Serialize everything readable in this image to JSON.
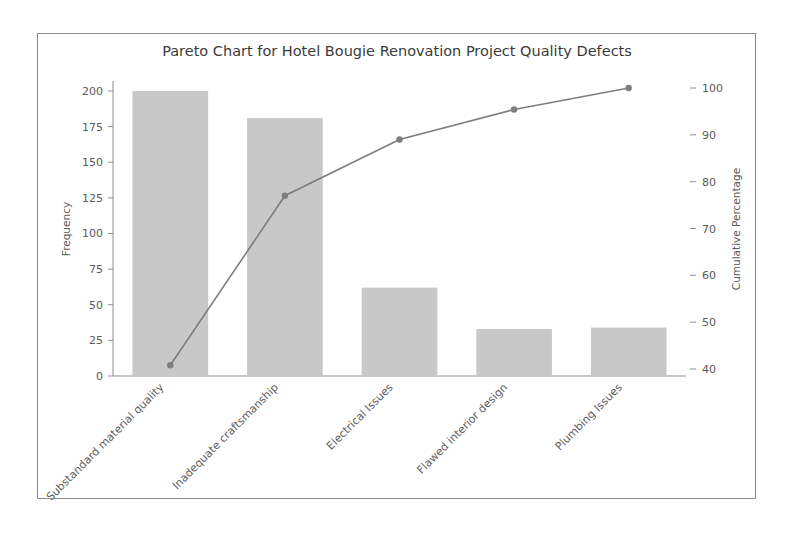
{
  "chart_data": {
    "type": "bar",
    "title": "Pareto Chart for Hotel Bougie Renovation Project Quality Defects",
    "categories": [
      "Substandard material quality",
      "Inadequate craftsmanship",
      "Electrical Issues",
      "Flawed interior design",
      "Plumbing Issues"
    ],
    "series": [
      {
        "name": "Frequency",
        "type": "bar",
        "axis": "left",
        "values": [
          200,
          181,
          62,
          33,
          34
        ]
      },
      {
        "name": "Cumulative Percentage",
        "type": "line",
        "axis": "right",
        "values": [
          40.8,
          77.0,
          89.0,
          95.4,
          100.0
        ]
      }
    ],
    "xlabel": "",
    "ylabel": "Frequency",
    "y2label": "Cumulative Percentage",
    "ylim": [
      0,
      207
    ],
    "y2lim": [
      38.5,
      101.5
    ],
    "yticks": [
      0,
      25,
      50,
      75,
      100,
      125,
      150,
      175,
      200
    ],
    "ytick_labels": [
      "0",
      "25",
      "50",
      "75",
      "100",
      "125",
      "150",
      "175",
      "200"
    ],
    "y2ticks": [
      40,
      50,
      60,
      70,
      80,
      90,
      100
    ],
    "y2tick_labels": [
      "40",
      "50",
      "60",
      "70",
      "80",
      "90",
      "100"
    ],
    "grid": false,
    "legend": false,
    "colors": {
      "bar": "#c8c8c8",
      "line": "#7e7e7e",
      "axis": "#8f8f8f",
      "text": "#5a5a5a",
      "frame": "#8a8a8a",
      "background": "#ffffff"
    },
    "x_tick_rotation": 45
  }
}
